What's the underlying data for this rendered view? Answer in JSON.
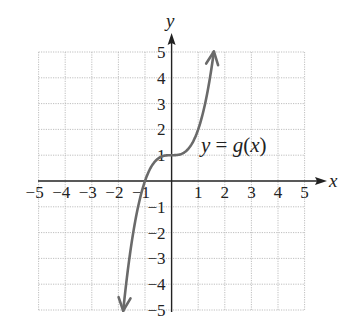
{
  "chart_data": {
    "type": "line",
    "title": "",
    "function_label": "y = g(x)",
    "function_label_parts": {
      "y": "y",
      "eq": " = ",
      "g": "g",
      "open": "(",
      "x": "x",
      "close": ")"
    },
    "xlabel": "x",
    "ylabel": "y",
    "xlim": [
      -5,
      5
    ],
    "ylim": [
      -5,
      5
    ],
    "grid": true,
    "x_ticks": [
      "−5",
      "−4",
      "−3",
      "−2",
      "−1",
      "1",
      "2",
      "3",
      "4",
      "5"
    ],
    "y_ticks": [
      "5",
      "4",
      "3",
      "2",
      "1",
      "−1",
      "−2",
      "−3",
      "−4",
      "−5"
    ],
    "series": [
      {
        "name": "g(x)",
        "formula_estimate": "x^3 + 1",
        "arrows_both_ends": true,
        "x": [
          -1.82,
          -1.5,
          -1.25,
          -1.0,
          -0.75,
          -0.5,
          -0.25,
          0,
          0.25,
          0.5,
          0.75,
          1.0,
          1.25,
          1.5,
          1.59
        ],
        "y": [
          -5.0,
          -2.38,
          -0.95,
          0.0,
          0.58,
          0.88,
          0.98,
          1.0,
          1.02,
          1.13,
          1.42,
          2.0,
          2.95,
          4.38,
          5.0
        ]
      }
    ],
    "key_points": [
      {
        "x": -1,
        "y": 0,
        "note": "x-intercept"
      },
      {
        "x": 0,
        "y": 1,
        "note": "y-intercept / inflection"
      }
    ]
  },
  "colors": {
    "curve": "#6a6a6a",
    "axis": "#222222",
    "grid": "#b8b8b8",
    "background": "#ffffff"
  }
}
